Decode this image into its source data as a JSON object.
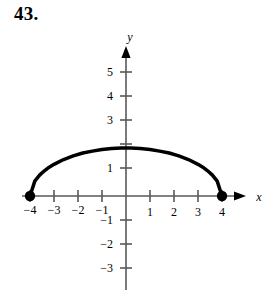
{
  "figure": {
    "problem_number": "43.",
    "background_color": "#ffffff",
    "ink_color": "#000000",
    "axis_color": "#595959",
    "curve_color": "#000000"
  },
  "axes": {
    "x_axis_label": "x",
    "y_axis_label": "y",
    "x_tick_labels": [
      "−4",
      "−3",
      "−2",
      "−1",
      "1",
      "2",
      "3",
      "4"
    ],
    "y_tick_labels": [
      "5",
      "4",
      "3",
      "1",
      "−1",
      "−2",
      "−3"
    ]
  },
  "chart_data": {
    "type": "line",
    "title": "43.",
    "xlabel": "x",
    "ylabel": "y",
    "xlim": [
      -4.9,
      5.0
    ],
    "ylim": [
      -3.6,
      5.9
    ],
    "xticks": [
      -4,
      -3,
      -2,
      -1,
      1,
      2,
      3,
      4
    ],
    "yticks": [
      5,
      4,
      3,
      1,
      -1,
      -2,
      -3
    ],
    "xtick_labels": [
      "−4",
      "−3",
      "−2",
      "−1",
      "1",
      "2",
      "3",
      "4"
    ],
    "ytick_labels": [
      "5",
      "4",
      "3",
      "1",
      "−1",
      "−2",
      "−3"
    ],
    "grid": false,
    "legend": "none",
    "series": [
      {
        "name": "upper half-ellipse",
        "style": "solid",
        "linewidth": 3.5,
        "color": "#000000",
        "x": [
          -4,
          -3.8,
          -3.6,
          -3.4,
          -3.2,
          -3,
          -2.6,
          -2.2,
          -1.8,
          -1.4,
          -1,
          -0.6,
          -0.2,
          0,
          0.2,
          0.6,
          1,
          1.4,
          1.8,
          2.2,
          2.6,
          3,
          3.2,
          3.4,
          3.6,
          3.8,
          4
        ],
        "y": [
          0,
          0.62,
          0.87,
          1.05,
          1.2,
          1.32,
          1.52,
          1.67,
          1.79,
          1.87,
          1.94,
          1.98,
          2,
          2,
          2,
          1.98,
          1.94,
          1.87,
          1.79,
          1.67,
          1.52,
          1.32,
          1.2,
          1.05,
          0.87,
          0.62,
          0
        ]
      }
    ],
    "endpoints": [
      {
        "x": -4,
        "y": 0,
        "marker": "filled-circle",
        "label": ""
      },
      {
        "x": 4,
        "y": 0,
        "marker": "filled-circle",
        "label": ""
      }
    ],
    "annotations": []
  }
}
